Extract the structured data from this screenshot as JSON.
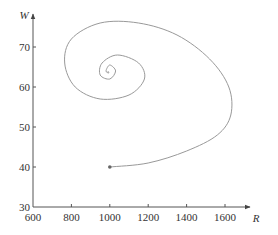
{
  "chart_data": {
    "type": "line",
    "title": "",
    "xlabel": "R",
    "ylabel": "W",
    "xlim": [
      600,
      1780
    ],
    "ylim": [
      30,
      78
    ],
    "x_ticks": [
      600,
      800,
      1000,
      1200,
      1400,
      1600
    ],
    "y_ticks": [
      30,
      40,
      50,
      60,
      70
    ],
    "grid": false,
    "legend": null,
    "series": [
      {
        "name": "phase trajectory",
        "description": "Spiral trajectory starting at (1000, 40) and converging to equilibrium near (1000, 64)",
        "start_point": {
          "R": 1000,
          "W": 40
        },
        "equilibrium": {
          "R": 990,
          "W": 64
        },
        "points": [
          {
            "R": 1000,
            "W": 40
          },
          {
            "R": 1200,
            "W": 41
          },
          {
            "R": 1400,
            "W": 44
          },
          {
            "R": 1560,
            "W": 48
          },
          {
            "R": 1630,
            "W": 53
          },
          {
            "R": 1620,
            "W": 60
          },
          {
            "R": 1520,
            "W": 67
          },
          {
            "R": 1350,
            "W": 73
          },
          {
            "R": 1150,
            "W": 76
          },
          {
            "R": 950,
            "W": 76
          },
          {
            "R": 800,
            "W": 72
          },
          {
            "R": 765,
            "W": 66
          },
          {
            "R": 820,
            "W": 60
          },
          {
            "R": 950,
            "W": 57
          },
          {
            "R": 1100,
            "W": 58
          },
          {
            "R": 1180,
            "W": 62
          },
          {
            "R": 1150,
            "W": 66
          },
          {
            "R": 1040,
            "W": 68
          },
          {
            "R": 960,
            "W": 66
          },
          {
            "R": 950,
            "W": 63
          },
          {
            "R": 1000,
            "W": 62
          },
          {
            "R": 1030,
            "W": 64
          },
          {
            "R": 1000,
            "W": 65.5
          },
          {
            "R": 980,
            "W": 64
          },
          {
            "R": 995,
            "W": 63.5
          },
          {
            "R": 990,
            "W": 64
          }
        ]
      }
    ],
    "colors": {
      "curve": "#999999",
      "axis": "#555555",
      "point": "#666666"
    }
  }
}
